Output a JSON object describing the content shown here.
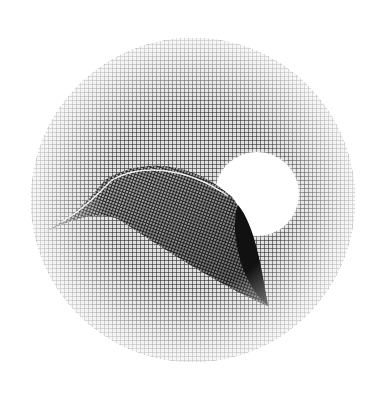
{
  "artwork": {
    "description": "Pen-and-ink crosshatched circular illustration of a leaf-like curved shell shape with a white moon behind it",
    "colors": {
      "background": "#ffffff",
      "ink": "#1a1a1a",
      "shadow": "#0d0d0d"
    },
    "disc": {
      "cx": 193,
      "cy": 200,
      "r": 162
    },
    "moon": {
      "cx": 257,
      "cy": 194,
      "r": 43
    }
  }
}
